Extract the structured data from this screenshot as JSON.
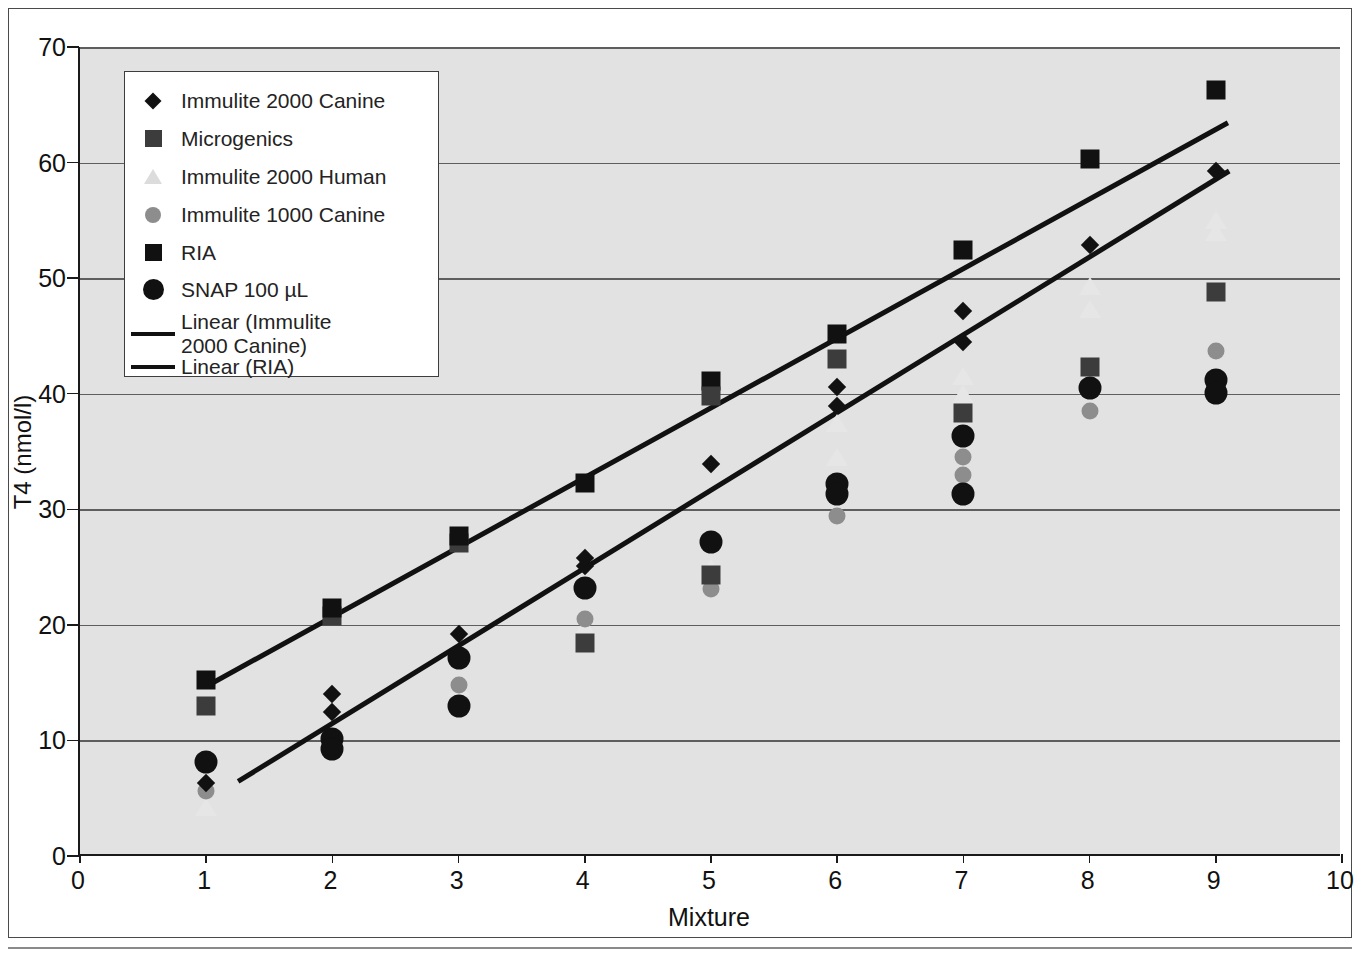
{
  "chart_data": {
    "type": "scatter",
    "title": "",
    "xlabel": "Mixture",
    "ylabel": "T4 (nmol/l)",
    "xlim": [
      0,
      10
    ],
    "ylim": [
      0,
      70
    ],
    "xticks": [
      0,
      1,
      2,
      3,
      4,
      5,
      6,
      7,
      8,
      9,
      10
    ],
    "yticks": [
      0,
      10,
      20,
      30,
      40,
      50,
      60,
      70
    ],
    "grid": "horizontal",
    "legend_position": "upper-left-inside",
    "x": [
      1,
      2,
      3,
      4,
      5,
      6,
      7,
      8,
      9
    ],
    "series": [
      {
        "name": "Immulite 2000 Canine",
        "marker": "diamond",
        "color": "#111111",
        "values": [
          6.3,
          12.5,
          19.2,
          25.1,
          33.9,
          38.9,
          44.5,
          52.9,
          59.3
        ]
      },
      {
        "name": "Microgenics",
        "marker": "square",
        "color": "#3c3c3c",
        "values": [
          13.0,
          20.8,
          27.1,
          18.4,
          24.3,
          43.0,
          38.3,
          42.3,
          48.8
        ]
      },
      {
        "name": "Immulite 2000 Human",
        "marker": "triangle",
        "color": "#e6e6e6",
        "values": [
          4.2,
          9.3,
          14.6,
          19.8,
          24.9,
          34.5,
          40.0,
          47.3,
          54.0
        ]
      },
      {
        "name": "Immulite 1000 Canine",
        "marker": "circle",
        "color": "#8d8d8d",
        "values": [
          5.6,
          10.0,
          14.8,
          20.5,
          23.1,
          29.4,
          33.0,
          38.5,
          43.7
        ]
      },
      {
        "name": "RIA",
        "marker": "square",
        "color": "#111111",
        "values": [
          15.2,
          21.5,
          27.7,
          32.3,
          41.1,
          45.2,
          52.4,
          60.3,
          66.3
        ]
      },
      {
        "name": "SNAP 100 µL",
        "marker": "circle-large",
        "color": "#111111",
        "values": [
          8.1,
          10.1,
          17.1,
          23.2,
          27.2,
          32.2,
          36.3,
          40.5,
          41.2
        ]
      }
    ],
    "extra_points": [
      {
        "series": "Immulite 2000 Canine",
        "x": 2,
        "y": 14.0
      },
      {
        "series": "Immulite 2000 Canine",
        "x": 4,
        "y": 25.8
      },
      {
        "series": "Immulite 2000 Canine",
        "x": 6,
        "y": 40.6
      },
      {
        "series": "Immulite 2000 Canine",
        "x": 7,
        "y": 47.2
      },
      {
        "series": "Immulite 2000 Human",
        "x": 6,
        "y": 37.5
      },
      {
        "series": "Immulite 2000 Human",
        "x": 7,
        "y": 41.5
      },
      {
        "series": "Immulite 2000 Human",
        "x": 8,
        "y": 49.3
      },
      {
        "series": "Immulite 2000 Human",
        "x": 9,
        "y": 55.0
      },
      {
        "series": "Immulite 1000 Canine",
        "x": 7,
        "y": 34.5
      },
      {
        "series": "Microgenics",
        "x": 5,
        "y": 39.8
      },
      {
        "series": "SNAP 100 µL",
        "x": 2,
        "y": 9.3
      },
      {
        "series": "SNAP 100 µL",
        "x": 3,
        "y": 13.0
      },
      {
        "series": "SNAP 100 µL",
        "x": 6,
        "y": 31.3
      },
      {
        "series": "SNAP 100 µL",
        "x": 7,
        "y": 31.3
      },
      {
        "series": "SNAP 100 µL",
        "x": 9,
        "y": 40.1
      }
    ],
    "trendlines": [
      {
        "name": "Linear (Immulite 2000 Canine)",
        "x0": 1.25,
        "y0": 6.5,
        "x1": 9.1,
        "y1": 59.3,
        "color": "#111111"
      },
      {
        "name": "Linear (RIA)",
        "x0": 1.0,
        "y0": 14.7,
        "x1": 9.1,
        "y1": 63.5,
        "color": "#111111"
      }
    ],
    "legend": [
      {
        "label": "Immulite 2000 Canine",
        "marker": "diamond",
        "color": "#111111"
      },
      {
        "label": "Microgenics",
        "marker": "square",
        "color": "#3c3c3c"
      },
      {
        "label": "Immulite 2000 Human",
        "marker": "triangle",
        "color": "#dcdcdc"
      },
      {
        "label": "Immulite 1000 Canine",
        "marker": "circle",
        "color": "#8d8d8d"
      },
      {
        "label": "RIA",
        "marker": "square",
        "color": "#111111"
      },
      {
        "label": "SNAP 100 µL",
        "marker": "circle-large",
        "color": "#111111"
      },
      {
        "label": "Linear (Immulite\n2000 Canine)",
        "marker": "line",
        "color": "#111111"
      },
      {
        "label": "Linear (RIA)",
        "marker": "line",
        "color": "#111111"
      }
    ]
  }
}
